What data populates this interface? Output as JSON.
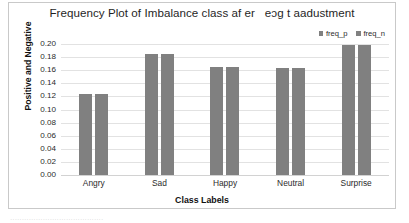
{
  "chart_data": {
    "type": "bar",
    "title": "Frequency Plot of Imbalance class af er   eɔg t aadustment",
    "xlabel": "Class Labels",
    "ylabel": "Positive and Negative",
    "categories": [
      "Angry",
      "Sad",
      "Happy",
      "Neutral",
      "Surprise"
    ],
    "series": [
      {
        "name": "freq_p",
        "values": [
          0.123,
          0.185,
          0.165,
          0.163,
          0.199
        ]
      },
      {
        "name": "freq_n",
        "values": [
          0.123,
          0.185,
          0.165,
          0.163,
          0.199
        ]
      }
    ],
    "ylim": [
      0.0,
      0.2
    ],
    "ytick_labels": [
      "0.20",
      "0.18",
      "0.16",
      "0.14",
      "0.12",
      "0.10",
      "0.08",
      "0.06",
      "0.04",
      "0.02",
      "0.00"
    ],
    "ytick_values": [
      0.2,
      0.18,
      0.16,
      0.14,
      0.12,
      0.1,
      0.08,
      0.06,
      0.04,
      0.02,
      0.0
    ],
    "grid": true,
    "legend_position": "top-right",
    "bar_color": "#808080",
    "gridline_color": "#e2e2e2",
    "frame_border_color": "#c9c9c9"
  },
  "caption": {
    "cutoff_text": "········································"
  }
}
